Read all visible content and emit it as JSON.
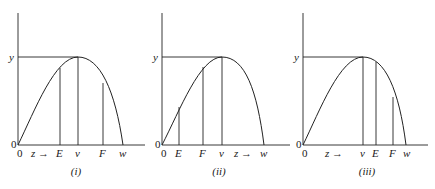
{
  "figure": {
    "panels": [
      {
        "id": "i",
        "caption": "(i)",
        "y_label": "y",
        "origin_label": "0",
        "origin_small_label": "0",
        "z_label": "z →",
        "tick_labels": [
          "E",
          "v",
          "F",
          "w"
        ],
        "order": "0, z→, E, v, F, w"
      },
      {
        "id": "ii",
        "caption": "(ii)",
        "y_label": "y",
        "origin_label": "0",
        "origin_small_label": "0",
        "z_label": "z →",
        "tick_labels": [
          "E",
          "F",
          "v",
          "w"
        ],
        "order": "0, E, F, v, z→, w"
      },
      {
        "id": "iii",
        "caption": "(iii)",
        "y_label": "y",
        "origin_label": "0",
        "origin_small_label": "0",
        "z_label": "z →",
        "tick_labels": [
          "v",
          "E",
          "F",
          "w"
        ],
        "order": "0, z→, v, E, F, w"
      }
    ]
  }
}
